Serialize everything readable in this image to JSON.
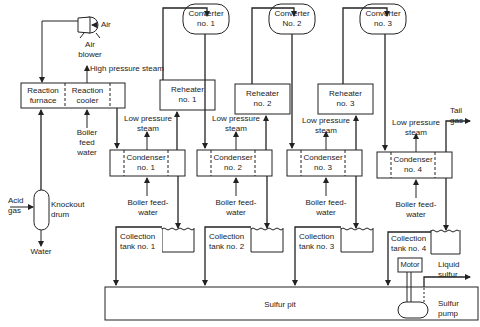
{
  "diagram": {
    "type": "process flow diagram",
    "inputs": {
      "air": "Air",
      "acid_gas": "Acid\ngas"
    },
    "outputs": {
      "water": "Water",
      "tail_gas": "Tail\ngas",
      "liquid_sulfur": "Liquid\nsulfur"
    },
    "equipment": {
      "air_blower": "Air\nblower",
      "knockout_drum": "Knockout\ndrum",
      "reaction_furnace": "Reaction\nfurnace",
      "reaction_cooler": "Reaction\ncooler",
      "reheaters": [
        "Reheater\nno. 1",
        "Reheater\nno. 2",
        "Reheater\nno. 3"
      ],
      "converters": [
        "Converter\nno. 1",
        "Converter\nNo. 2",
        "Converter\nno. 3"
      ],
      "condensers": [
        "Condenser\nno. 1",
        "Condenser\nno. 2",
        "Condenser\nno. 3",
        "Condenser\nno. 4"
      ],
      "collection_tanks": [
        "Collection\ntank no. 1",
        "Collection\ntank no. 2",
        "Collection\ntank no. 3",
        "Collection\ntank no. 4"
      ],
      "sulfur_pit": "Sulfur pit",
      "motor": "Motor",
      "sulfur_pump": "Sulfur\npump"
    },
    "streams": {
      "high_pressure_steam": "High pressure steam",
      "boiler_feed_water_furnace": "Boiler\nfeed\nwater",
      "low_pressure_steam": "Low pressure\nsteam",
      "boiler_feed_water_condenser": "Boiler feed-\nwater"
    }
  }
}
